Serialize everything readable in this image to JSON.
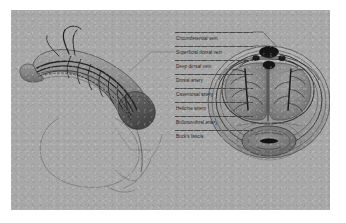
{
  "figure": {
    "panel_bg": "#a8a8a8",
    "ink": "#2b2b2b",
    "labels": [
      {
        "id": "circumflex-vein",
        "text": "Circumferential vein",
        "y": 22,
        "leader_to_x": 268,
        "leader_to_y": 39
      },
      {
        "id": "superficial-dorsal-vein",
        "text": "Superficial dorsal vein",
        "y": 36,
        "leader_to_x": 266,
        "leader_to_y": 44
      },
      {
        "id": "deep-dorsal-vein",
        "text": "Deep dorsal vein",
        "y": 50,
        "leader_to_x": 262,
        "leader_to_y": 50
      },
      {
        "id": "dorsal-artery",
        "text": "Dorsal artery",
        "y": 64,
        "leader_to_x": 258,
        "leader_to_y": 57
      },
      {
        "id": "cavernosal-artery",
        "text": "Cavernosal artery",
        "y": 78,
        "leader_to_x": 252,
        "leader_to_y": 72
      },
      {
        "id": "helicine-artery",
        "text": "Helicine artery",
        "y": 92,
        "leader_to_x": 250,
        "leader_to_y": 86
      },
      {
        "id": "bulbourethral-artery",
        "text": "Bulbourethral artery",
        "y": 106,
        "leader_to_x": 249,
        "leader_to_y": 118
      },
      {
        "id": "buck-fascia",
        "text": "Buck's fascia",
        "y": 120,
        "leader_to_x": 247,
        "leader_to_y": 130
      }
    ],
    "lateral_view": {
      "name": "lateral-penis-illustration",
      "caption": "Lateral view of penile shaft with superficial and deep vessels"
    },
    "cross_section": {
      "name": "penile-cross-section-illustration",
      "caption": "Transverse section showing paired corpora cavernosa and corpus spongiosum"
    }
  }
}
